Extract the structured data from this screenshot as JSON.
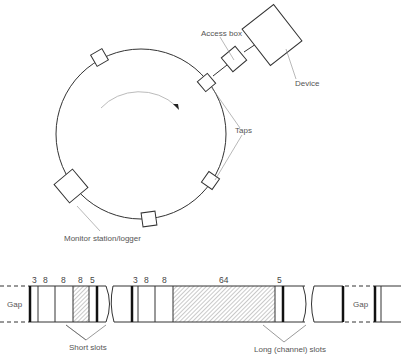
{
  "ring": {
    "labels": {
      "access_box": "Access box",
      "device": "Device",
      "taps": "Taps",
      "monitor": "Monitor station/logger"
    }
  },
  "slot_strip": {
    "gap_left": "Gap",
    "gap_right": "Gap",
    "segment1_numbers": [
      "3",
      "8",
      "8",
      "8",
      "5"
    ],
    "segment2_numbers": [
      "3",
      "8",
      "8",
      "64",
      "5"
    ],
    "short_slots_label": "Short slots",
    "long_slots_label": "Long (channel) slots"
  },
  "colors": {
    "line": "#333333",
    "leader": "#888888",
    "text": "#555555"
  }
}
